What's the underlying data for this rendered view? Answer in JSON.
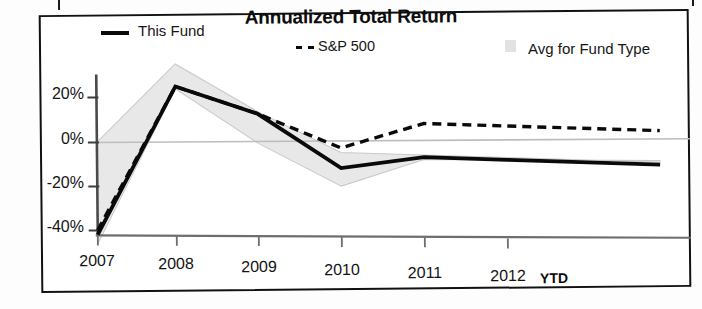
{
  "chart_data": {
    "type": "line",
    "title": "Annualized Total Return",
    "xlabel": "",
    "ylabel": "",
    "x": [
      "2007",
      "2008",
      "2009",
      "2010",
      "2011",
      "2012 YTD"
    ],
    "categories": [
      "2007",
      "2008",
      "2009",
      "2010",
      "2011",
      "2012"
    ],
    "ytick_labels": [
      "20%",
      "0%",
      "-20%",
      "-40%"
    ],
    "ytick_values": [
      20,
      0,
      -20,
      -40
    ],
    "ylim": [
      -45,
      38
    ],
    "grid": false,
    "legend_position": "top",
    "series": [
      {
        "name": "This Fund",
        "style": "solid",
        "color": "#0a0a0a",
        "values": [
          -41,
          25,
          13,
          -11,
          -6,
          -7
        ]
      },
      {
        "name": "S&P 500",
        "style": "dashed",
        "color": "#0a0a0a",
        "values": [
          -39,
          25,
          13,
          -2,
          9,
          8
        ]
      },
      {
        "name": "Avg for Fund Type",
        "style": "band",
        "color": "#e6e6e6",
        "upper": [
          0,
          35,
          14,
          -4,
          -5,
          -6
        ],
        "lower": [
          -45,
          24,
          0,
          -19,
          -7,
          -7
        ]
      }
    ],
    "annotations": [
      "YTD"
    ]
  },
  "chart": {
    "title": "Annualized Total Return",
    "legend": [
      {
        "label": "This Fund",
        "marker": "solid-line-swatch"
      },
      {
        "label": "S&P 500",
        "marker": "dashed-line-swatch"
      },
      {
        "label": "Avg for Fund Type",
        "marker": "gray-area-swatch"
      }
    ],
    "y_axis": {
      "ticks": [
        "20%",
        "0%",
        "-20%",
        "-40%"
      ]
    },
    "x_axis": {
      "ticks": [
        "2007",
        "2008",
        "2009",
        "2010",
        "2011",
        "2012"
      ],
      "suffix": "YTD"
    }
  }
}
